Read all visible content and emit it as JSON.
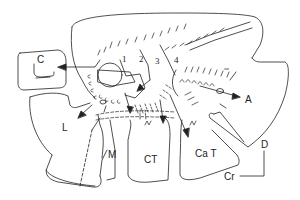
{
  "diagram": {
    "regions": {
      "C": "C",
      "L": "L",
      "M": "M",
      "CT": "CT",
      "CaT": "Ca T",
      "A": "A"
    },
    "numbers": [
      "1",
      "2",
      "3",
      "4"
    ],
    "small_mark": "sw",
    "orientation": {
      "dorsal": "D",
      "cranial": "Cr"
    },
    "colors": {
      "line": "#222222",
      "background": "#ffffff"
    }
  }
}
